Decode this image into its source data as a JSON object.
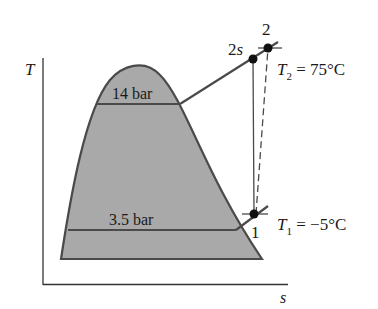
{
  "diagram": {
    "type": "T-s diagram (vapor-compression refrigeration, compressor process)",
    "axes": {
      "y_label": "T",
      "x_label": "s"
    },
    "isobars": [
      {
        "label": "14 bar",
        "role": "high pressure"
      },
      {
        "label": "3.5 bar",
        "role": "low pressure"
      }
    ],
    "states": [
      {
        "id": "1",
        "label": "1",
        "annotation_symbol": "T",
        "annotation_sub": "1",
        "annotation_value": " = −5°C"
      },
      {
        "id": "2s",
        "label": "2s"
      },
      {
        "id": "2",
        "label": "2",
        "annotation_symbol": "T",
        "annotation_sub": "2",
        "annotation_value": " = 75°C"
      }
    ],
    "processes": [
      {
        "from": "1",
        "to": "2s",
        "style": "solid",
        "meaning": "isentropic compression"
      },
      {
        "from": "1",
        "to": "2",
        "style": "dashed",
        "meaning": "actual compression"
      }
    ],
    "colors": {
      "dome_fill": "#a9a9a9",
      "line": "#4a4a4a",
      "point": "#111111",
      "axis": "#333333"
    }
  }
}
